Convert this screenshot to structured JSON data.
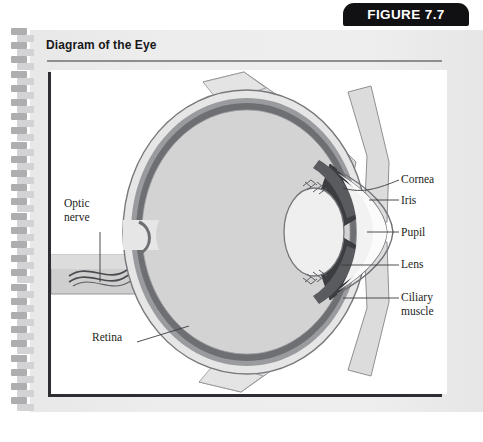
{
  "figure": {
    "tab_label": "FIGURE 7.7",
    "title": "Diagram of the Eye"
  },
  "diagram": {
    "name": "eye-cross-section",
    "labels": {
      "optic_nerve_line1": "Optic",
      "optic_nerve_line2": "nerve",
      "retina": "Retina",
      "cornea": "Cornea",
      "iris": "Iris",
      "pupil": "Pupil",
      "lens": "Lens",
      "ciliary_line1": "Ciliary",
      "ciliary_line2": "muscle"
    }
  },
  "colors": {
    "tab_background": "#111113",
    "tab_text": "#ffffff",
    "page_background": "#ececed",
    "canvas_background": "#ffffff",
    "title_text": "#17181a",
    "rule": "#8d8e92",
    "sclera_outer": "#e2e2e3",
    "choroid": "#8d8e92",
    "retina_band": "#6b6c70",
    "vitreous": "#d2d2d3",
    "iris_dark": "#3a3b3f",
    "ciliary_dark": "#55565a",
    "muscle_band": "#dcdcdd",
    "outline": "#6e6f73",
    "label_text": "#1d1e20",
    "binding_dark": "#aeaeb0",
    "binding_light": "#d3d3d5"
  }
}
